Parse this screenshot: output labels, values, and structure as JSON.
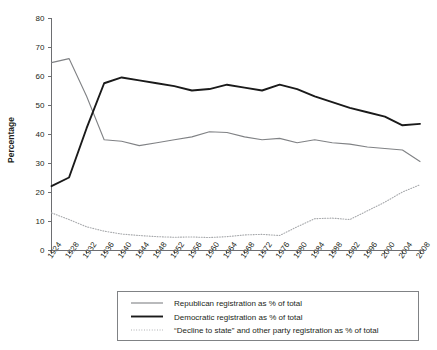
{
  "chart_data": {
    "type": "line",
    "title": "",
    "xlabel": "",
    "ylabel": "Percentage",
    "ylim": [
      0,
      80
    ],
    "ytick_step": 10,
    "grid": false,
    "legend_position": "bottom",
    "categories": [
      "1924",
      "1928",
      "1932",
      "1936",
      "1940",
      "1944",
      "1948",
      "1952",
      "1956",
      "1960",
      "1964",
      "1968",
      "1972",
      "1976",
      "1980",
      "1984",
      "1988",
      "1992",
      "1996",
      "2000",
      "2004",
      "2008"
    ],
    "yticks": [
      "0",
      "10",
      "20",
      "30",
      "40",
      "50",
      "60",
      "70",
      "80"
    ],
    "series": [
      {
        "name": "Republican registration as % of total",
        "color": "#808285",
        "style": "solid-thin",
        "values": [
          64.6,
          66.0,
          53.0,
          38.0,
          37.5,
          36.0,
          37.0,
          38.0,
          39.0,
          40.8,
          40.5,
          39.0,
          38.0,
          38.5,
          37.0,
          38.0,
          37.0,
          36.5,
          35.5,
          35.0,
          34.5,
          30.5
        ]
      },
      {
        "name": "Democratic registration as % of total",
        "color": "#1a1a1a",
        "style": "solid-thick",
        "values": [
          22.0,
          25.0,
          42.0,
          57.5,
          59.5,
          58.5,
          57.5,
          56.5,
          55.0,
          55.5,
          57.0,
          56.0,
          55.0,
          57.0,
          55.5,
          53.0,
          51.0,
          49.0,
          47.5,
          46.0,
          43.0,
          43.5
        ]
      },
      {
        "name": "“Decline to state” and other party registration as % of total",
        "color": "#a7a9ac",
        "style": "dotted",
        "values": [
          12.8,
          10.5,
          8.0,
          6.5,
          5.5,
          5.0,
          4.6,
          4.4,
          4.5,
          4.3,
          4.6,
          5.2,
          5.4,
          5.0,
          8.0,
          10.8,
          11.0,
          10.5,
          13.5,
          16.5,
          20.0,
          22.5
        ]
      }
    ]
  },
  "axis": {
    "y_title": "Percentage"
  },
  "legend": {
    "items": [
      {
        "label": "Republican registration as % of total"
      },
      {
        "label": "Democratic registration as % of total"
      },
      {
        "label": "“Decline to state” and other party registration as % of total"
      }
    ]
  }
}
